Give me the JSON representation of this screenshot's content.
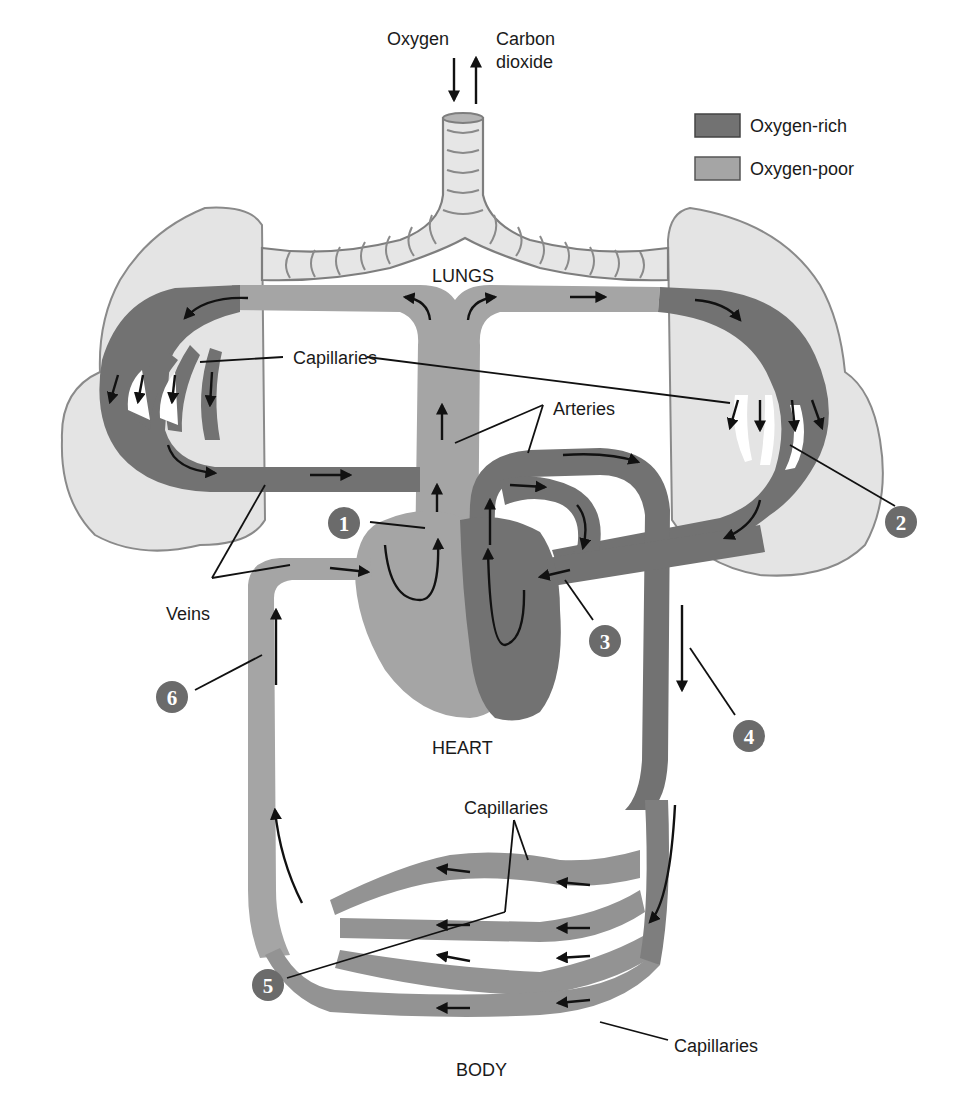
{
  "figure": {
    "type": "pulmonary and systemic circulation diagram",
    "colors": {
      "oxygen_rich": "#727272",
      "oxygen_poor": "#a5a5a5",
      "lung_tissue": "#e4e4e4",
      "badge": "#6b6b6b"
    }
  },
  "gas_exchange": {
    "oxygen_label": "Oxygen",
    "co2_label_line1": "Carbon",
    "co2_label_line2": "dioxide"
  },
  "legend": {
    "items": [
      {
        "label": "Oxygen-rich",
        "color": "#727272"
      },
      {
        "label": "Oxygen-poor",
        "color": "#a5a5a5"
      }
    ]
  },
  "regions": {
    "lungs": "LUNGS",
    "heart": "HEART",
    "body": "BODY"
  },
  "labels": {
    "capillaries_lungs": "Capillaries",
    "arteries": "Arteries",
    "veins": "Veins",
    "capillaries_body_upper": "Capillaries",
    "capillaries_body_lower": "Capillaries"
  },
  "steps": [
    {
      "number": "1"
    },
    {
      "number": "2"
    },
    {
      "number": "3"
    },
    {
      "number": "4"
    },
    {
      "number": "5"
    },
    {
      "number": "6"
    }
  ]
}
